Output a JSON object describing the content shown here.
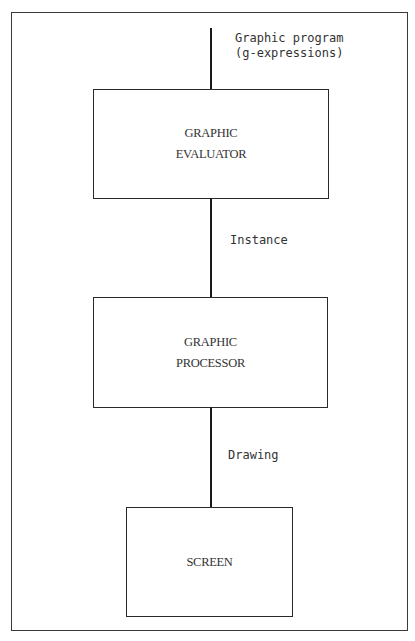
{
  "input_label": [
    "Graphic program",
    "(g-expressions)"
  ],
  "boxes": [
    {
      "lines": [
        "GRAPHIC",
        "EVALUATOR"
      ]
    },
    {
      "lines": [
        "GRAPHIC",
        "PROCESSOR"
      ]
    },
    {
      "lines": [
        "SCREEN"
      ]
    }
  ],
  "edges": [
    {
      "label": "Instance"
    },
    {
      "label": "Drawing"
    }
  ],
  "colors": {
    "stroke": "#2a2a2a",
    "text": "#333333",
    "background": "#ffffff"
  }
}
